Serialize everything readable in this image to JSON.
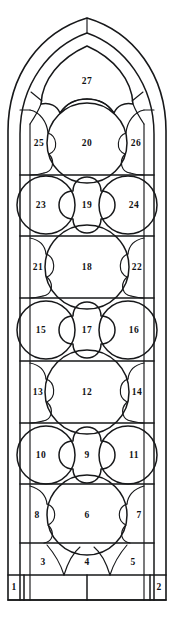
{
  "diagram": {
    "kind": "architectural-window-schematic",
    "shape": "lancet-pointed-arch",
    "line_color": "#17181a",
    "background_color": "#ffffff",
    "width_px": 174,
    "height_px": 621
  },
  "panels": [
    {
      "id": "p1",
      "label": "1",
      "x": 14,
      "y": 587,
      "shape": "rectangle",
      "row": "sill",
      "position": "left-end"
    },
    {
      "id": "p2",
      "label": "2",
      "x": 159,
      "y": 587,
      "shape": "rectangle",
      "row": "sill",
      "position": "right-end"
    },
    {
      "id": "p3",
      "label": "3",
      "x": 43,
      "y": 563,
      "shape": "spandrel",
      "row": "row-1",
      "position": "left"
    },
    {
      "id": "p4",
      "label": "4",
      "x": 87,
      "y": 563,
      "shape": "spandrel",
      "row": "row-1",
      "position": "center"
    },
    {
      "id": "p5",
      "label": "5",
      "x": 133,
      "y": 563,
      "shape": "spandrel",
      "row": "row-1",
      "position": "right"
    },
    {
      "id": "p6",
      "label": "6",
      "x": 87,
      "y": 515,
      "shape": "circle",
      "row": "row-2",
      "position": "center"
    },
    {
      "id": "p7",
      "label": "7",
      "x": 138,
      "y": 515,
      "shape": "lobe",
      "row": "row-2",
      "position": "right"
    },
    {
      "id": "p8",
      "label": "8",
      "x": 38,
      "y": 515,
      "shape": "lobe",
      "row": "row-2",
      "position": "left"
    },
    {
      "id": "p9",
      "label": "9",
      "x": 87,
      "y": 455,
      "shape": "quatrefoil",
      "row": "row-3",
      "position": "center"
    },
    {
      "id": "p10",
      "label": "10",
      "x": 41,
      "y": 455,
      "shape": "circle",
      "row": "row-3",
      "position": "left"
    },
    {
      "id": "p11",
      "label": "11",
      "x": 134,
      "y": 455,
      "shape": "circle",
      "row": "row-3",
      "position": "right"
    },
    {
      "id": "p12",
      "label": "12",
      "x": 87,
      "y": 392,
      "shape": "circle",
      "row": "row-4",
      "position": "center"
    },
    {
      "id": "p13",
      "label": "13",
      "x": 38,
      "y": 392,
      "shape": "lobe",
      "row": "row-4",
      "position": "left"
    },
    {
      "id": "p14",
      "label": "14",
      "x": 138,
      "y": 392,
      "shape": "lobe",
      "row": "row-4",
      "position": "right"
    },
    {
      "id": "p15",
      "label": "15",
      "x": 41,
      "y": 330,
      "shape": "circle",
      "row": "row-5",
      "position": "left"
    },
    {
      "id": "p16",
      "label": "16",
      "x": 134,
      "y": 330,
      "shape": "circle",
      "row": "row-5",
      "position": "right"
    },
    {
      "id": "p17",
      "label": "17",
      "x": 87,
      "y": 330,
      "shape": "quatrefoil",
      "row": "row-5",
      "position": "center"
    },
    {
      "id": "p18",
      "label": "18",
      "x": 87,
      "y": 266,
      "shape": "circle",
      "row": "row-6",
      "position": "center"
    },
    {
      "id": "p19",
      "label": "19",
      "x": 87,
      "y": 205,
      "shape": "quatrefoil",
      "row": "row-7",
      "position": "center"
    },
    {
      "id": "p20",
      "label": "20",
      "x": 87,
      "y": 143,
      "shape": "circle",
      "row": "row-8",
      "position": "center"
    },
    {
      "id": "p21",
      "label": "21",
      "x": 38,
      "y": 266,
      "shape": "lobe",
      "row": "row-6",
      "position": "left"
    },
    {
      "id": "p22",
      "label": "22",
      "x": 137,
      "y": 266,
      "shape": "lobe",
      "row": "row-6",
      "position": "right"
    },
    {
      "id": "p23",
      "label": "23",
      "x": 41,
      "y": 205,
      "shape": "circle",
      "row": "row-7",
      "position": "left"
    },
    {
      "id": "p24",
      "label": "24",
      "x": 134,
      "y": 205,
      "shape": "circle",
      "row": "row-7",
      "position": "right"
    },
    {
      "id": "p25",
      "label": "25",
      "x": 39,
      "y": 143,
      "shape": "lobe",
      "row": "row-8",
      "position": "left"
    },
    {
      "id": "p26",
      "label": "26",
      "x": 135,
      "y": 143,
      "shape": "lobe",
      "row": "row-8",
      "position": "right"
    },
    {
      "id": "p27",
      "label": "27",
      "x": 87,
      "y": 81,
      "shape": "arch-head",
      "row": "tracery-head",
      "position": "center"
    }
  ]
}
